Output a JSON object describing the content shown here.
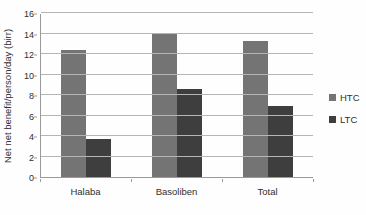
{
  "chart_data": {
    "type": "bar",
    "title": "",
    "ylabel": "Net net benefit/person/day (birr)",
    "xlabel": "",
    "ylim": [
      0,
      16
    ],
    "ytick_step": 2,
    "yticks": [
      0,
      2,
      4,
      6,
      8,
      10,
      12,
      14,
      16
    ],
    "grid": true,
    "legend_position": "right",
    "categories": [
      "Halaba",
      "Basoliben",
      "Total"
    ],
    "series": [
      {
        "name": "HTC",
        "color": "#747474",
        "values": [
          12.4,
          14.0,
          13.3
        ]
      },
      {
        "name": "LTC",
        "color": "#3e3e3e",
        "values": [
          3.7,
          8.6,
          6.9
        ]
      }
    ],
    "grid_color": "#b5b5b5",
    "axis_color": "#9a9a9a",
    "text_color": "#2f2f2f",
    "background_color": "#fefefe"
  }
}
